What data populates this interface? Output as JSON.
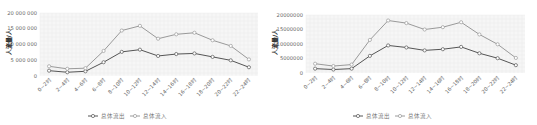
{
  "chart_data": [
    {
      "type": "line",
      "title": "",
      "xlabel": "",
      "ylabel": "人流量/人",
      "ylim": [
        0,
        20000000
      ],
      "yticks": [
        "0",
        "5 000 000",
        "10 000 000",
        "15 000 000",
        "20 000 000"
      ],
      "categories": [
        "0~2时",
        "2~4时",
        "4~6时",
        "6~8时",
        "8~10时",
        "10~12时",
        "12~14时",
        "14~16时",
        "16~18时",
        "18~20时",
        "20~22时",
        "22~24时"
      ],
      "series": [
        {
          "name": "总体流出",
          "color": "#555555",
          "values": [
            1600000,
            1100000,
            1400000,
            4300000,
            7600000,
            8300000,
            6300000,
            6900000,
            7100000,
            6000000,
            4900000,
            2700000
          ]
        },
        {
          "name": "总体流入",
          "color": "#9a9a9a",
          "values": [
            3000000,
            2200000,
            2400000,
            7900000,
            14400000,
            15900000,
            11800000,
            13200000,
            13700000,
            11300000,
            9500000,
            5200000
          ]
        }
      ],
      "legend_position": "bottom",
      "grid": true
    },
    {
      "type": "line",
      "title": "",
      "xlabel": "",
      "ylabel": "人流量/人",
      "ylim": [
        0,
        20000000
      ],
      "yticks": [
        "0",
        "5000000",
        "10000000",
        "15000000",
        "20000000"
      ],
      "categories": [
        "0~2时",
        "2~4时",
        "4~6时",
        "6~8时",
        "8~10时",
        "10~12时",
        "12~14时",
        "14~16时",
        "16~18时",
        "18~20时",
        "20~22时",
        "22~24时"
      ],
      "series": [
        {
          "name": "总体流出",
          "color": "#555555",
          "values": [
            1500000,
            1200000,
            1500000,
            5900000,
            9500000,
            8800000,
            7800000,
            8200000,
            9000000,
            6800000,
            5100000,
            2700000
          ]
        },
        {
          "name": "总体流入",
          "color": "#9a9a9a",
          "values": [
            3200000,
            2400000,
            2900000,
            11400000,
            18100000,
            17200000,
            15000000,
            15800000,
            17500000,
            13300000,
            9900000,
            5200000
          ]
        }
      ],
      "legend_position": "bottom",
      "grid": true
    }
  ]
}
